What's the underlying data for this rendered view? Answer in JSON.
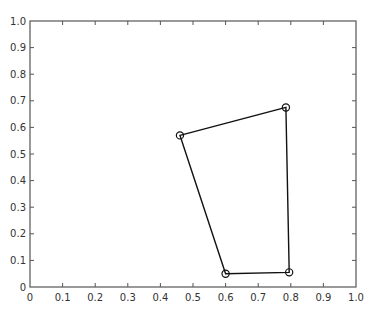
{
  "chart_data": {
    "type": "line",
    "title": "",
    "xlabel": "",
    "ylabel": "",
    "xlim": [
      0,
      1.0
    ],
    "ylim": [
      0,
      1.0
    ],
    "grid": false,
    "legend": null,
    "box": true,
    "x_ticks": [
      0,
      0.1,
      0.2,
      0.3,
      0.4,
      0.5,
      0.6,
      0.7,
      0.8,
      0.9,
      1.0
    ],
    "x_tick_labels": [
      "0",
      "0.1",
      "0.2",
      "0.3",
      "0.4",
      "0.5",
      "0.6",
      "0.7",
      "0.8",
      "0.9",
      "1.0"
    ],
    "y_ticks": [
      0,
      0.1,
      0.2,
      0.3,
      0.4,
      0.5,
      0.6,
      0.7,
      0.8,
      0.9,
      1.0
    ],
    "y_tick_labels": [
      "0",
      "0.1",
      "0.2",
      "0.3",
      "0.4",
      "0.5",
      "0.6",
      "0.7",
      "0.8",
      "0.9",
      "1.0"
    ],
    "series": [
      {
        "name": "polygon",
        "closed": true,
        "marker": "open-circle",
        "color": "#111111",
        "points": [
          {
            "x": 0.46,
            "y": 0.57
          },
          {
            "x": 0.785,
            "y": 0.675
          },
          {
            "x": 0.795,
            "y": 0.055
          },
          {
            "x": 0.6,
            "y": 0.05
          }
        ]
      }
    ]
  },
  "style": {
    "axis_color": "#555555",
    "line_color": "#111111",
    "background": "#ffffff"
  }
}
